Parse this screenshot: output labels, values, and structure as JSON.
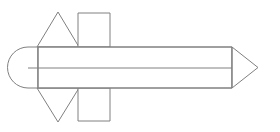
{
  "figure": {
    "title": "Rocket profile line drawing",
    "type": "line-drawing",
    "background_color": "#ffffff",
    "stroke_color": "#808080",
    "fill_color": "#ffffff",
    "stroke_width": 1,
    "canvas": {
      "width": 280,
      "height": 132
    },
    "parts": [
      {
        "name": "nose-cap",
        "label": "Rounded nose cap",
        "shape": "semicircle",
        "x": 17,
        "y": 47,
        "width": 23,
        "height": 41
      },
      {
        "name": "body",
        "label": "Cylindrical body",
        "shape": "rectangle",
        "x": 38,
        "y": 47,
        "width": 194,
        "height": 41
      },
      {
        "name": "body-divider",
        "label": "Horizontal body divider line",
        "shape": "line",
        "x1": 28,
        "y1": 68,
        "x2": 232,
        "y2": 68
      },
      {
        "name": "nose-tip",
        "label": "Conical point",
        "shape": "triangle",
        "x": 232,
        "y": 47,
        "width": 26,
        "height": 41
      },
      {
        "name": "top-triangular-fin",
        "label": "Upper triangular fin",
        "shape": "triangle",
        "apex_x": 58,
        "apex_y": 12,
        "base_left_x": 37,
        "base_right_x": 79,
        "base_y": 47
      },
      {
        "name": "bottom-triangular-fin",
        "label": "Lower triangular fin",
        "shape": "triangle",
        "apex_x": 58,
        "apex_y": 122,
        "base_left_x": 37,
        "base_right_x": 79,
        "base_y": 88
      },
      {
        "name": "top-rectangular-fin",
        "label": "Upper rectangular fin",
        "shape": "rectangle",
        "x": 78,
        "y": 13,
        "width": 32,
        "height": 34
      },
      {
        "name": "bottom-rectangular-fin",
        "label": "Lower rectangular fin",
        "shape": "rectangle",
        "x": 78,
        "y": 88,
        "width": 32,
        "height": 33
      }
    ]
  }
}
